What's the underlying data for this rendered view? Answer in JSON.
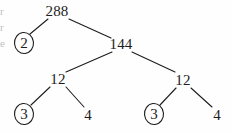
{
  "diagram": {
    "type": "factor-tree",
    "background_color": "#fefefe",
    "ink_color": "#1d1d1d",
    "nodes": [
      {
        "id": "root",
        "label": "288",
        "x": 57,
        "y": 11,
        "circled": false
      },
      {
        "id": "n2",
        "label": "2",
        "x": 24,
        "y": 43,
        "circled": true
      },
      {
        "id": "n144",
        "label": "144",
        "x": 121,
        "y": 44,
        "circled": false
      },
      {
        "id": "n12-left",
        "label": "12",
        "x": 58,
        "y": 79,
        "circled": false
      },
      {
        "id": "n12-right",
        "label": "12",
        "x": 183,
        "y": 80,
        "circled": false
      },
      {
        "id": "n3-left",
        "label": "3",
        "x": 24,
        "y": 114,
        "circled": true
      },
      {
        "id": "n4-left",
        "label": "4",
        "x": 88,
        "y": 115,
        "circled": false
      },
      {
        "id": "n3-right",
        "label": "3",
        "x": 154,
        "y": 114,
        "circled": true
      },
      {
        "id": "n4-right",
        "label": "4",
        "x": 217,
        "y": 115,
        "circled": false
      }
    ],
    "edges": [
      {
        "id": "edge-288-2",
        "from": "root",
        "to": "n2",
        "x1": 48,
        "y1": 19,
        "x2": 30,
        "y2": 34
      },
      {
        "id": "edge-288-144",
        "from": "root",
        "to": "n144",
        "x1": 69,
        "y1": 19,
        "x2": 111,
        "y2": 38
      },
      {
        "id": "edge-144-12L",
        "from": "n144",
        "to": "n12-left",
        "x1": 112,
        "y1": 52,
        "x2": 66,
        "y2": 72
      },
      {
        "id": "edge-144-12R",
        "from": "n144",
        "to": "n12-right",
        "x1": 132,
        "y1": 52,
        "x2": 175,
        "y2": 72
      },
      {
        "id": "edge-12L-3",
        "from": "n12-left",
        "to": "n3-left",
        "x1": 50,
        "y1": 87,
        "x2": 31,
        "y2": 105
      },
      {
        "id": "edge-12L-4",
        "from": "n12-left",
        "to": "n4-left",
        "x1": 66,
        "y1": 87,
        "x2": 84,
        "y2": 107
      },
      {
        "id": "edge-12R-3",
        "from": "n12-right",
        "to": "n3-right",
        "x1": 176,
        "y1": 88,
        "x2": 160,
        "y2": 105
      },
      {
        "id": "edge-12R-4",
        "from": "n12-right",
        "to": "n4-right",
        "x1": 191,
        "y1": 88,
        "x2": 212,
        "y2": 107
      }
    ],
    "circle_rx": 9.5,
    "circle_ry": 10.5
  },
  "margin_fragments": [
    {
      "id": "frag-1",
      "text": "r",
      "y": 6
    },
    {
      "id": "frag-2",
      "text": "r",
      "y": 22
    },
    {
      "id": "frag-3",
      "text": "e",
      "y": 38
    }
  ]
}
